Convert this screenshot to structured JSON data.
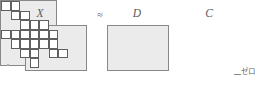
{
  "figure": {
    "caption_symbols": {
      "x_label": "X",
      "approx_operator": "≈",
      "d_label": "D",
      "c_label": "C"
    },
    "annotation": {
      "zero_label": "ゼロ"
    },
    "colors": {
      "matrix_fill": "#ebebeb",
      "matrix_border": "#888888",
      "cell_fill": "#ffffff",
      "cell_border": "#606060",
      "text": "#5a5a5a",
      "background": "#ffffff"
    },
    "matrices": [
      {
        "name": "X",
        "label": "X",
        "role": "data-matrix",
        "fill": "solid"
      },
      {
        "name": "D",
        "label": "D",
        "role": "dictionary-matrix",
        "fill": "solid"
      },
      {
        "name": "C",
        "label": "C",
        "role": "sparse-coefficient-matrix",
        "fill": "sparse"
      }
    ],
    "sparse_grid": {
      "columns": 7,
      "rows": 8,
      "cell_width": 9.5,
      "cell_height": 9.5,
      "nonzero_cells": [
        [
          0,
          0
        ],
        [
          1,
          0
        ],
        [
          1,
          1
        ],
        [
          2,
          1
        ],
        [
          2,
          2
        ],
        [
          3,
          2
        ],
        [
          3,
          3
        ],
        [
          3,
          4
        ],
        [
          2,
          3
        ],
        [
          2,
          4
        ],
        [
          2,
          5
        ],
        [
          1,
          3
        ],
        [
          1,
          4
        ],
        [
          0,
          3
        ],
        [
          4,
          2
        ],
        [
          4,
          3
        ],
        [
          5,
          3
        ],
        [
          5,
          4
        ],
        [
          3,
          5
        ],
        [
          3,
          6
        ],
        [
          5,
          5
        ],
        [
          6,
          5
        ],
        [
          4,
          4
        ]
      ]
    }
  }
}
